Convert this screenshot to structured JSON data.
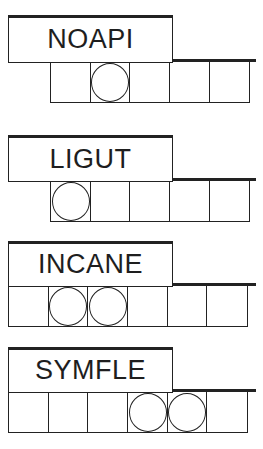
{
  "puzzles": [
    {
      "scrambled": "NOAPI",
      "letter_count": 5,
      "circled_positions": [
        2
      ],
      "layout": {
        "box_top": 15,
        "box_bottom": 61,
        "cells_bottom": 103,
        "cells_left": 50
      }
    },
    {
      "scrambled": "LIGUT",
      "letter_count": 5,
      "circled_positions": [
        1
      ],
      "layout": {
        "box_top": 135,
        "box_bottom": 180,
        "cells_bottom": 222,
        "cells_left": 50
      }
    },
    {
      "scrambled": "INCANE",
      "letter_count": 6,
      "circled_positions": [
        2,
        3
      ],
      "layout": {
        "box_top": 241,
        "box_bottom": 285,
        "cells_bottom": 327,
        "cells_left": 8
      }
    },
    {
      "scrambled": "SYMFLE",
      "letter_count": 6,
      "circled_positions": [
        4,
        5
      ],
      "layout": {
        "box_top": 347,
        "box_bottom": 391,
        "cells_bottom": 433,
        "cells_left": 8
      }
    }
  ],
  "colors": {
    "ink": "#222222",
    "text": "#1e1e1e",
    "background": "#ffffff"
  }
}
